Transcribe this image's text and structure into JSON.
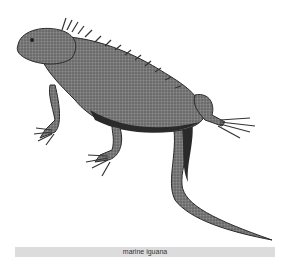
{
  "image": {
    "subject": "marine iguana illustration",
    "caption": "marine iguana"
  },
  "colors": {
    "background": "#ffffff",
    "caption_bar": "#dcdcdc",
    "body_fill": "#6e6e6e",
    "shadow": "#2a2a2a"
  }
}
